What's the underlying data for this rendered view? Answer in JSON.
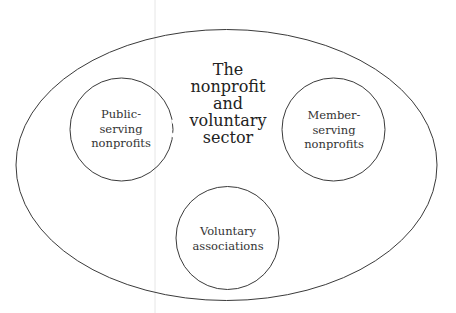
{
  "diagram": {
    "outer": {
      "label_lines": [
        "The",
        "nonprofit",
        "and",
        "voluntary",
        "sector"
      ]
    },
    "circles": [
      {
        "id": "public-serving",
        "label_lines": [
          "Public-",
          "serving",
          "nonprofits"
        ]
      },
      {
        "id": "member-serving",
        "label_lines": [
          "Member-",
          "serving",
          "nonprofits"
        ]
      },
      {
        "id": "voluntary-associations",
        "label_lines": [
          "Voluntary",
          "associations"
        ]
      }
    ],
    "colors": {
      "stroke": "#3a3a3a",
      "text": "#2a2a2a",
      "background": "#ffffff"
    }
  }
}
